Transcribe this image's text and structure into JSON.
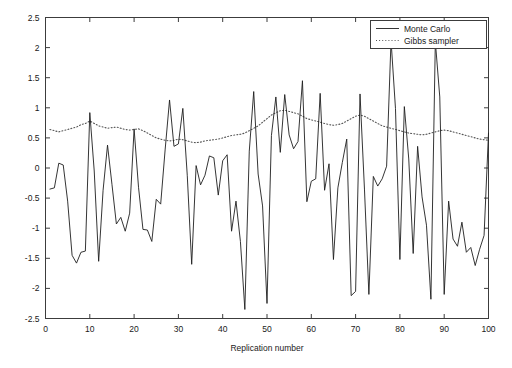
{
  "chart_data": {
    "type": "line",
    "title": "",
    "xlabel": "Replication number",
    "ylabel": "",
    "xlim": [
      0,
      100
    ],
    "ylim": [
      -2.5,
      2.5
    ],
    "xticks": [
      0,
      10,
      20,
      30,
      40,
      50,
      60,
      70,
      80,
      90,
      100
    ],
    "xticklabels": [
      "0",
      "10",
      "20",
      "30",
      "40",
      "50",
      "60",
      "70",
      "80",
      "90",
      "100"
    ],
    "yticks": [
      -2.5,
      -2,
      -1.5,
      -1,
      -0.5,
      0,
      0.5,
      1,
      1.5,
      2,
      2.5
    ],
    "yticklabels": [
      "-2.5",
      "-2",
      "-1.5",
      "-1",
      "-0.5",
      "0",
      "0.5",
      "1",
      "1.5",
      "2",
      "2.5"
    ],
    "grid": false,
    "box": true,
    "tick_direction": "in",
    "legend_position": "top-right",
    "legend_entries": [
      "Monte Carlo",
      "Gibbs sampler"
    ],
    "x": [
      1,
      2,
      3,
      4,
      5,
      6,
      7,
      8,
      9,
      10,
      11,
      12,
      13,
      14,
      15,
      16,
      17,
      18,
      19,
      20,
      21,
      22,
      23,
      24,
      25,
      26,
      27,
      28,
      29,
      30,
      31,
      32,
      33,
      34,
      35,
      36,
      37,
      38,
      39,
      40,
      41,
      42,
      43,
      44,
      45,
      46,
      47,
      48,
      49,
      50,
      51,
      52,
      53,
      54,
      55,
      56,
      57,
      58,
      59,
      60,
      61,
      62,
      63,
      64,
      65,
      66,
      67,
      68,
      69,
      70,
      71,
      72,
      73,
      74,
      75,
      76,
      77,
      78,
      79,
      80,
      81,
      82,
      83,
      84,
      85,
      86,
      87,
      88,
      89,
      90,
      91,
      92,
      93,
      94,
      95,
      96,
      97,
      98,
      99,
      100
    ],
    "series": [
      {
        "name": "Monte Carlo",
        "style": "solid",
        "color": "#1e1e1e",
        "values": [
          -0.35,
          -0.33,
          0.08,
          0.05,
          -0.55,
          -1.45,
          -1.58,
          -1.4,
          -1.38,
          0.92,
          -0.05,
          -1.55,
          -0.37,
          0.38,
          -0.27,
          -0.93,
          -0.82,
          -1.05,
          -0.75,
          0.65,
          -0.32,
          -1.02,
          -1.03,
          -1.22,
          -0.52,
          -0.6,
          0.3,
          1.13,
          0.36,
          0.4,
          0.99,
          -0.12,
          -1.6,
          0.04,
          -0.28,
          -0.12,
          0.2,
          0.17,
          -0.45,
          0.12,
          0.22,
          -1.05,
          -0.55,
          -1.22,
          -2.35,
          0.28,
          1.27,
          -0.1,
          -0.63,
          -2.25,
          0.54,
          1.18,
          0.26,
          1.22,
          0.55,
          0.32,
          0.44,
          1.45,
          -0.56,
          -0.22,
          -0.18,
          1.24,
          -0.37,
          0.07,
          -1.52,
          -0.33,
          0.09,
          0.48,
          -2.12,
          -2.05,
          1.23,
          -0.35,
          -2.1,
          -0.14,
          -0.3,
          -0.18,
          0.03,
          2.12,
          0.99,
          -1.52,
          1.02,
          0.15,
          -1.42,
          0.36,
          -0.48,
          -0.95,
          -2.18,
          2.1,
          1.18,
          -2.1,
          -0.55,
          -1.18,
          -1.3,
          -0.9,
          -1.4,
          -1.32,
          -1.62,
          -1.35,
          -1.12,
          0.58
        ]
      },
      {
        "name": "Gibbs sampler",
        "style": "dotted",
        "color": "#555555",
        "values": [
          0.64,
          0.62,
          0.6,
          0.62,
          0.64,
          0.66,
          0.68,
          0.72,
          0.74,
          0.78,
          0.74,
          0.7,
          0.68,
          0.66,
          0.67,
          0.68,
          0.66,
          0.64,
          0.63,
          0.64,
          0.65,
          0.62,
          0.58,
          0.54,
          0.5,
          0.48,
          0.46,
          0.45,
          0.46,
          0.48,
          0.47,
          0.45,
          0.43,
          0.42,
          0.43,
          0.45,
          0.46,
          0.47,
          0.48,
          0.5,
          0.52,
          0.54,
          0.55,
          0.56,
          0.58,
          0.62,
          0.66,
          0.7,
          0.76,
          0.82,
          0.88,
          0.92,
          0.95,
          0.96,
          0.94,
          0.92,
          0.9,
          0.86,
          0.82,
          0.8,
          0.78,
          0.76,
          0.74,
          0.72,
          0.71,
          0.72,
          0.74,
          0.78,
          0.82,
          0.86,
          0.88,
          0.86,
          0.82,
          0.78,
          0.74,
          0.7,
          0.68,
          0.66,
          0.64,
          0.62,
          0.6,
          0.58,
          0.57,
          0.56,
          0.55,
          0.56,
          0.58,
          0.6,
          0.62,
          0.63,
          0.62,
          0.6,
          0.58,
          0.56,
          0.54,
          0.52,
          0.5,
          0.48,
          0.47,
          0.46
        ]
      }
    ]
  },
  "axes": {
    "xlabel": "Replication number"
  },
  "legend": {
    "entries": [
      {
        "label": "Monte Carlo",
        "style": "solid"
      },
      {
        "label": "Gibbs sampler",
        "style": "dotted"
      }
    ]
  }
}
